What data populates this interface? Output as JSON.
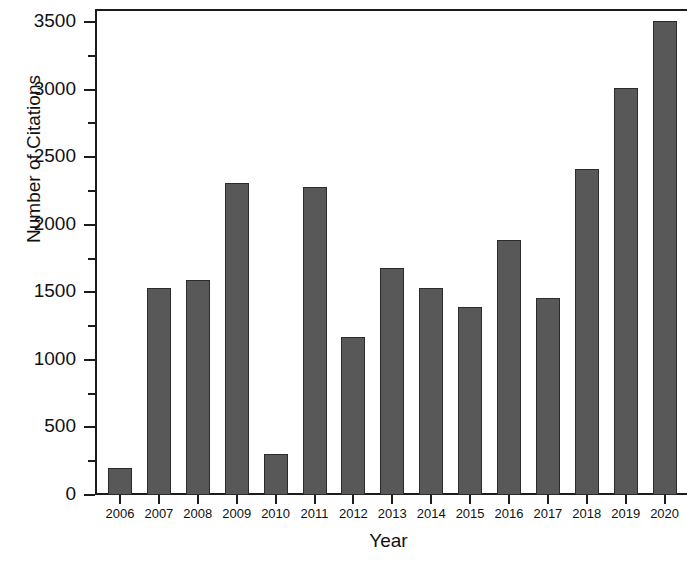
{
  "chart_data": {
    "type": "bar",
    "title": "",
    "xlabel": "Year",
    "ylabel": "Number of Citations",
    "categories": [
      "2006",
      "2007",
      "2008",
      "2009",
      "2010",
      "2011",
      "2012",
      "2013",
      "2014",
      "2015",
      "2016",
      "2017",
      "2018",
      "2019",
      "2020"
    ],
    "values": [
      200,
      1530,
      1590,
      2310,
      300,
      2280,
      1170,
      1680,
      1530,
      1390,
      1890,
      1460,
      2410,
      3010,
      3510
    ],
    "ylim": [
      0,
      3500
    ],
    "xlim_note": "categorical years 2006-2020, last bar clipped at right edge",
    "y_major_ticks": [
      0,
      500,
      1000,
      1500,
      2000,
      2500,
      3000,
      3500
    ],
    "y_minor_ticks": [
      250,
      750,
      1250,
      1750,
      2250,
      2750,
      3250
    ],
    "y_tick_labels": [
      "0",
      "500",
      "1000",
      "1500",
      "2000",
      "2500",
      "3000",
      "3500"
    ],
    "grid": false,
    "legend": null,
    "legend_position": "none",
    "bar_color": "#585858",
    "bar_edge_color": "#2b2b2b",
    "axis_color": "#1c1c1c",
    "background_color": "#ffffff"
  }
}
